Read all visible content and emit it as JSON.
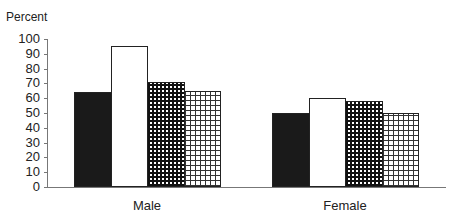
{
  "chart_data": {
    "type": "bar",
    "title": "",
    "ylabel": "Percent",
    "xlabel": "",
    "categories": [
      "Male",
      "Female"
    ],
    "series": [
      {
        "name": "Series 1 (solid black)",
        "values": [
          64,
          50
        ]
      },
      {
        "name": "Series 2 (white)",
        "values": [
          95,
          60
        ]
      },
      {
        "name": "Series 3 (dense grid)",
        "values": [
          71,
          58
        ]
      },
      {
        "name": "Series 4 (sparse grid)",
        "values": [
          65,
          50
        ]
      }
    ],
    "ylim": [
      0,
      100
    ],
    "yticks": [
      0,
      10,
      20,
      30,
      40,
      50,
      60,
      70,
      80,
      90,
      100
    ],
    "grid": false,
    "legend": "none"
  }
}
